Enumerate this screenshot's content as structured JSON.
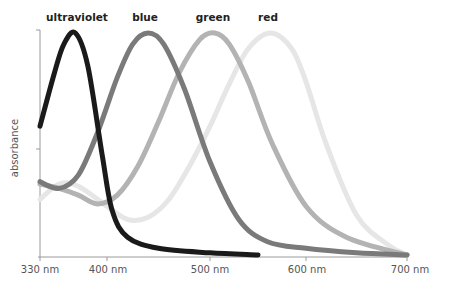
{
  "chart_data": {
    "type": "line",
    "title": "",
    "xlabel": "",
    "ylabel": "absorbance",
    "x_ticks": [
      "330 nm",
      "400 nm",
      "500 nm",
      "600 nm",
      "700 nm"
    ],
    "x_tick_values": [
      330,
      400,
      500,
      600,
      700
    ],
    "xlim": [
      330,
      700
    ],
    "ylim": [
      0,
      1
    ],
    "grid": false,
    "legend": "labels above each peak",
    "series": [
      {
        "name": "ultraviolet",
        "color": "#1a1a1a",
        "peak_nm": 367,
        "x": [
          330,
          345,
          355,
          367,
          380,
          395,
          405,
          420,
          450,
          500,
          550
        ],
        "values": [
          0.58,
          0.82,
          0.95,
          1.0,
          0.85,
          0.45,
          0.2,
          0.08,
          0.03,
          0.01,
          0.0
        ]
      },
      {
        "name": "blue",
        "color": "#7a7a7a",
        "peak_nm": 440,
        "x": [
          330,
          350,
          370,
          390,
          410,
          425,
          440,
          455,
          475,
          500,
          530,
          560,
          600,
          650,
          700
        ],
        "values": [
          0.33,
          0.3,
          0.36,
          0.55,
          0.8,
          0.95,
          1.0,
          0.95,
          0.75,
          0.42,
          0.16,
          0.06,
          0.03,
          0.01,
          0.0
        ]
      },
      {
        "name": "green",
        "color": "#b3b3b3",
        "peak_nm": 505,
        "x": [
          330,
          350,
          370,
          390,
          410,
          430,
          450,
          470,
          490,
          505,
          520,
          540,
          565,
          600,
          640,
          700
        ],
        "values": [
          0.32,
          0.3,
          0.27,
          0.23,
          0.27,
          0.4,
          0.6,
          0.82,
          0.97,
          1.0,
          0.95,
          0.78,
          0.5,
          0.22,
          0.08,
          0.0
        ]
      },
      {
        "name": "red",
        "color": "#e6e6e6",
        "peak_nm": 563,
        "x": [
          330,
          350,
          370,
          400,
          420,
          440,
          460,
          480,
          500,
          520,
          540,
          563,
          585,
          600,
          620,
          650,
          680,
          700
        ],
        "values": [
          0.25,
          0.32,
          0.31,
          0.22,
          0.16,
          0.17,
          0.25,
          0.4,
          0.58,
          0.77,
          0.93,
          1.0,
          0.93,
          0.78,
          0.5,
          0.18,
          0.05,
          0.0
        ]
      }
    ]
  },
  "labels": {
    "ultraviolet": "ultraviolet",
    "blue": "blue",
    "green": "green",
    "red": "red",
    "ylabel": "absorbance",
    "ticks": [
      "330 nm",
      "400 nm",
      "500 nm",
      "600 nm",
      "700 nm"
    ]
  }
}
